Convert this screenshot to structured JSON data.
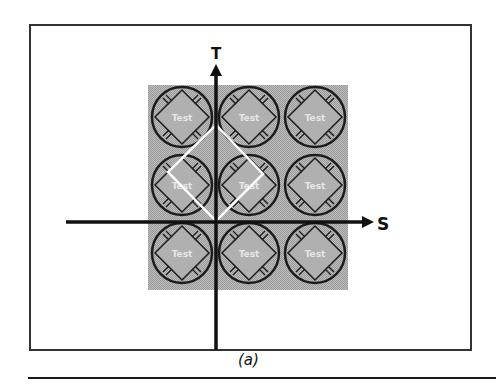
{
  "figure": {
    "caption": "(a)",
    "axes": {
      "vertical_label": "T",
      "horizontal_label": "S"
    },
    "grid": {
      "rows": 3,
      "cols": 3,
      "cell_label": "Test",
      "cells": [
        {
          "row": 0,
          "col": 0,
          "label": "Test"
        },
        {
          "row": 0,
          "col": 1,
          "label": "Test"
        },
        {
          "row": 0,
          "col": 2,
          "label": "Test"
        },
        {
          "row": 1,
          "col": 0,
          "label": "Test"
        },
        {
          "row": 1,
          "col": 1,
          "label": "Test"
        },
        {
          "row": 1,
          "col": 2,
          "label": "Test"
        },
        {
          "row": 2,
          "col": 0,
          "label": "Test"
        },
        {
          "row": 2,
          "col": 1,
          "label": "Test"
        },
        {
          "row": 2,
          "col": 2,
          "label": "Test"
        }
      ]
    },
    "colors": {
      "frame": "#333333",
      "background_block": "#b4b4b4",
      "circle_stroke": "#1c1c1c",
      "diamond_fill": "#a8a8a8",
      "highlight_diamond": "#ffffff",
      "axis": "#111111"
    }
  }
}
